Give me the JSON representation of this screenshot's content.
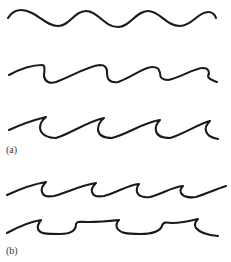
{
  "figure": {
    "panels": [
      {
        "label": "(a)",
        "description": "Three wave sketches progressing from symmetric sine wave to asymmetric waves to breaking (curling) waves"
      },
      {
        "label": "(b)",
        "description": "Two breaking-wave sketches: sharp curling crests and flat-bottomed curled crests"
      }
    ],
    "rows": [
      {
        "panel": "a",
        "name": "sinusoidal-wave",
        "crests": 4
      },
      {
        "panel": "a",
        "name": "asymmetric-wave",
        "crests": 3
      },
      {
        "panel": "a",
        "name": "curling-wave",
        "crests": 4
      },
      {
        "panel": "b",
        "name": "steep-breaking-wave",
        "crests": 4
      },
      {
        "panel": "b",
        "name": "flat-trough-breaking-wave",
        "crests": 4
      }
    ],
    "stroke_color": "#1a1a1a",
    "background": "#ffffff"
  }
}
